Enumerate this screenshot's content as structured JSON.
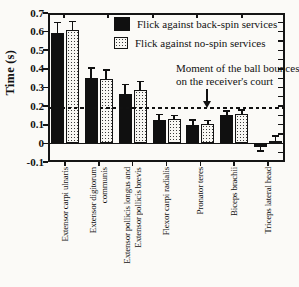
{
  "figure": {
    "background": "#fbfaf7"
  },
  "colors": {
    "bar_fill_backspin": "#101010",
    "stipple_background": "#f8f7f3",
    "stipple_dot": "#3c3c3c",
    "axis": "#151515",
    "text": "#111111",
    "paper": "#fbfaf7"
  },
  "chart_data": {
    "type": "bar",
    "title": "",
    "xlabel": "",
    "ylabel": "Time (s)",
    "ylim": [
      -0.1,
      0.7
    ],
    "yticks": [
      {
        "v": 0.7,
        "label": "0.7"
      },
      {
        "v": 0.6,
        "label": "0.6"
      },
      {
        "v": 0.5,
        "label": "0.5"
      },
      {
        "v": 0.4,
        "label": "0.4"
      },
      {
        "v": 0.3,
        "label": "0.3"
      },
      {
        "v": 0.2,
        "label": "0.2"
      },
      {
        "v": 0.1,
        "label": "0.1"
      },
      {
        "v": 0.0,
        "label": "0"
      },
      {
        "v": -0.1,
        "label": "-0.1"
      }
    ],
    "categories": [
      "Extensor carpi ulnaris",
      "Extensor digitorum\ncommunis",
      "Extensor pollicis longus and\nExtensor pollicis brevis",
      "Flexor carpi radialis",
      "Pronator teres",
      "Biceps brachii",
      "Triceps lateral head"
    ],
    "series": [
      {
        "name": "Flick against back-spin services",
        "fill": "solid-black",
        "values": [
          0.59,
          0.35,
          0.265,
          0.125,
          0.1,
          0.155,
          -0.02
        ],
        "errors": [
          0.06,
          0.055,
          0.05,
          0.03,
          0.025,
          0.02,
          0.02
        ]
      },
      {
        "name": "Flick against no-spin services",
        "fill": "stipple",
        "values": [
          0.61,
          0.345,
          0.285,
          0.13,
          0.105,
          0.16,
          0.015
        ],
        "errors": [
          0.045,
          0.05,
          0.048,
          0.02,
          0.018,
          0.018,
          0.025
        ]
      }
    ],
    "error_bars": "one-sided with caps, away from zero",
    "reference_line": {
      "value": 0.19,
      "style": "dashed",
      "label_line1": "Moment of the ball bounces",
      "label_line2": "on the receiver's court"
    },
    "legend_position": "top-right-inside",
    "grid": false
  }
}
